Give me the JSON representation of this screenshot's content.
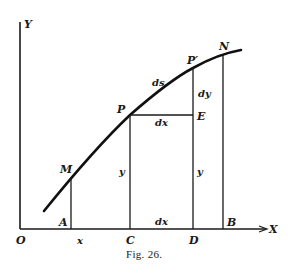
{
  "figure": {
    "caption": "Fig. 26.",
    "axes": {
      "x_label": "X",
      "y_label": "Y",
      "origin_label": "O"
    },
    "points": {
      "M": "M",
      "P": "P",
      "P_prime": "P′",
      "N": "N",
      "E": "E",
      "A": "A",
      "C": "C",
      "D": "D",
      "B": "B"
    },
    "segment_labels": {
      "ds": "ds",
      "dy": "dy",
      "dx_upper": "dx",
      "dx_lower": "dx",
      "x": "x",
      "y_left": "y",
      "y_right": "y"
    },
    "colors": {
      "ink": "#1a1a1a",
      "background": "#ffffff"
    }
  }
}
